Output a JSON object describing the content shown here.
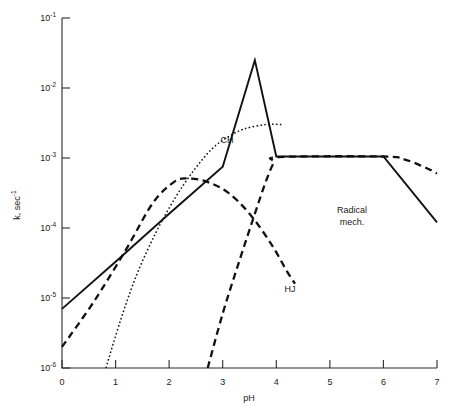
{
  "chart_data": {
    "type": "line",
    "title": "",
    "xlabel": "pH",
    "ylabel": "k, sec⁻¹",
    "xlim": [
      0,
      7
    ],
    "ylim": [
      1e-06,
      0.1
    ],
    "yscale": "log",
    "grid": false,
    "legend": "inline-annotations",
    "xticks": [
      "0",
      "1",
      "2",
      "3",
      "4",
      "5",
      "6",
      "7"
    ],
    "yticks": [
      "10⁻¹",
      "10⁻²",
      "10⁻³",
      "10⁻⁴",
      "10⁻⁵",
      "10⁻⁶"
    ],
    "ytick_values": [
      0.1,
      0.01,
      0.001,
      0.0001,
      1e-05,
      1e-06
    ],
    "annotations": [
      {
        "text": "CH",
        "x": 3.05,
        "y": 0.00145
      },
      {
        "text": "HJ",
        "x": 3.9,
        "y": 1.45e-05
      },
      {
        "text": "Radical mech.",
        "line1": "Radical",
        "line2": "mech.",
        "x": 5.1,
        "y": 0.00015
      }
    ],
    "series": [
      {
        "name": "solid-total",
        "style": "solid",
        "points": [
          [
            0.0,
            7e-06
          ],
          [
            1.0,
            3.3e-05
          ],
          [
            2.0,
            0.00016
          ],
          [
            3.0,
            0.00075
          ],
          [
            3.6,
            0.025
          ],
          [
            4.0,
            0.00105
          ],
          [
            6.0,
            0.00105
          ],
          [
            7.0,
            0.00012
          ]
        ]
      },
      {
        "name": "dashed-HJ",
        "style": "dashed",
        "points": [
          [
            0.0,
            2e-06
          ],
          [
            0.6,
            9e-06
          ],
          [
            1.2,
            5e-05
          ],
          [
            1.7,
            0.00023
          ],
          [
            2.1,
            0.00046
          ],
          [
            2.35,
            0.00051
          ],
          [
            2.7,
            0.00046
          ],
          [
            3.1,
            0.00032
          ],
          [
            3.5,
            0.00016
          ],
          [
            3.9,
            6e-05
          ],
          [
            4.2,
            2.4e-05
          ],
          [
            4.35,
            1.6e-05
          ]
        ]
      },
      {
        "name": "dashed-radical",
        "style": "dashed",
        "points": [
          [
            2.72,
            1e-06
          ],
          [
            3.0,
            6e-06
          ],
          [
            3.3,
            3.2e-05
          ],
          [
            3.6,
            0.00016
          ],
          [
            3.8,
            0.00045
          ],
          [
            3.95,
            0.00085
          ],
          [
            4.05,
            0.00103
          ],
          [
            6.0,
            0.00105
          ],
          [
            6.4,
            0.00095
          ],
          [
            6.8,
            0.00072
          ],
          [
            7.0,
            0.0006
          ]
        ]
      },
      {
        "name": "dotted-CH",
        "style": "dotted",
        "points": [
          [
            0.82,
            1e-06
          ],
          [
            1.1,
            5e-06
          ],
          [
            1.4,
            2.2e-05
          ],
          [
            1.75,
            8.5e-05
          ],
          [
            2.1,
            0.00026
          ],
          [
            2.45,
            0.00065
          ],
          [
            2.8,
            0.00135
          ],
          [
            3.1,
            0.002
          ],
          [
            3.4,
            0.0026
          ],
          [
            3.8,
            0.003
          ],
          [
            4.1,
            0.003
          ]
        ]
      }
    ]
  },
  "figure": {
    "x_axis_label": "pH",
    "y_axis_label": "k, sec",
    "y_axis_label_exponent": "-1"
  }
}
